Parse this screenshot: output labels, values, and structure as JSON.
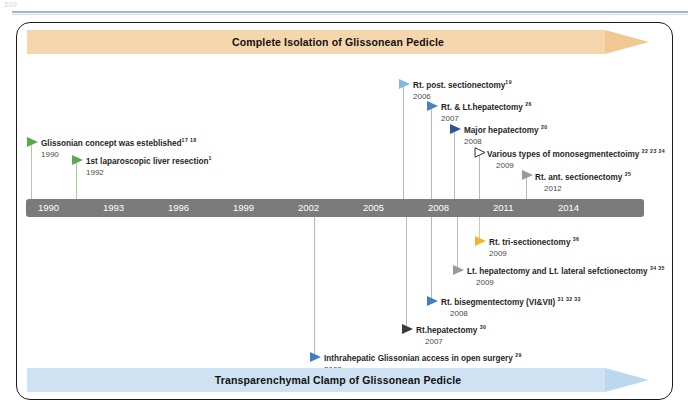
{
  "page": {
    "folio": "200"
  },
  "figure": {
    "top_banner": {
      "label": "Complete Isolation of Glissonean Pedicle",
      "color": "#f6d6ac"
    },
    "bottom_banner": {
      "label": "Transparenchymal Clamp of Glissonean Pedicle",
      "color": "#cfe2f3"
    },
    "axis": {
      "color": "#7b7b7b",
      "ticks": [
        "1990",
        "1993",
        "1996",
        "1999",
        "2002",
        "2005",
        "2008",
        "2011",
        "2014"
      ]
    },
    "events_above": [
      {
        "title": "Glissonian concept was esteblished",
        "sup": "17 18",
        "year": "1990",
        "marker": "green"
      },
      {
        "title": "1st laparoscopic liver resection",
        "sup": "1",
        "year": "1992",
        "marker": "green"
      },
      {
        "title": "Rt. post. sectionectomy",
        "sup": "19",
        "year": "2006",
        "marker": "blue-lt"
      },
      {
        "title": "Rt. & Lt.hepatectomy",
        "sup": "26",
        "year": "2007",
        "marker": "blue-md"
      },
      {
        "title": "Major hepatectomy",
        "sup": "20",
        "year": "2008",
        "marker": "blue-dk"
      },
      {
        "title": "Various types of monosegmentectoimy",
        "sup": "22 23 24",
        "year": "2009",
        "marker": "hollow"
      },
      {
        "title": "Rt. ant. sectionectomy",
        "sup": "25",
        "year": "2012",
        "marker": "gray"
      }
    ],
    "events_below": [
      {
        "title": "Rt. tri-sectionectomy",
        "sup": "36",
        "year": "2009",
        "marker": "amber"
      },
      {
        "title": "Lt. hepatectomy and Lt. lateral sefctionectomy",
        "sup": "34 35",
        "year": "2009",
        "marker": "gray"
      },
      {
        "title": "Rt. bisegmentectomy (VI&VII)",
        "sup": "31 32 33",
        "year": "2008",
        "marker": "blue-st"
      },
      {
        "title": "Rt.hepatectomy",
        "sup": "30",
        "year": "2007",
        "marker": "dark"
      },
      {
        "title": "Inthrahepatic Glissonian access in open surgery",
        "sup": "29",
        "year": "2003",
        "marker": "blue-st"
      }
    ]
  }
}
